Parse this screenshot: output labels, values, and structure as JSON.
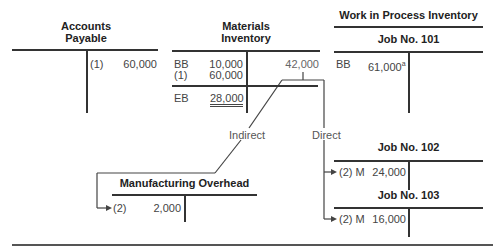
{
  "accounts_payable": {
    "title_line1": "Accounts",
    "title_line2": "Payable",
    "credit": [
      {
        "ref": "(1)",
        "amount": "60,000"
      }
    ]
  },
  "materials_inventory": {
    "title_line1": "Materials",
    "title_line2": "Inventory",
    "debits": [
      {
        "ref": "BB",
        "amount": "10,000"
      },
      {
        "ref": "(1)",
        "amount": "60,000"
      }
    ],
    "credit": "42,000",
    "ending": {
      "ref": "EB",
      "amount": "28,000"
    }
  },
  "flow_labels": {
    "indirect": "Indirect",
    "direct": "Direct"
  },
  "work_in_process": {
    "title": "Work in Process Inventory",
    "jobs": [
      {
        "title": "Job No. 101",
        "ref": "BB",
        "amount": "61,000",
        "footnote": "a"
      },
      {
        "title": "Job No. 102",
        "ref": "(2) M",
        "amount": "24,000"
      },
      {
        "title": "Job No. 103",
        "ref": "(2) M",
        "amount": "16,000"
      }
    ]
  },
  "manufacturing_overhead": {
    "title": "Manufacturing Overhead",
    "ref": "(2)",
    "amount": "2,000"
  }
}
